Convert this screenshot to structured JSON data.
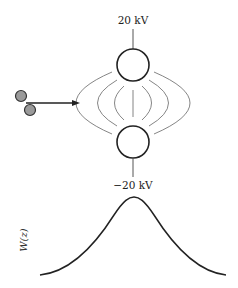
{
  "diagram": {
    "top_electrode": {
      "voltage_label": "20 kV"
    },
    "bottom_electrode": {
      "voltage_label": "−20 kV"
    },
    "plot": {
      "ylabel": "W(z)"
    },
    "icons": {
      "particles": "molecule-icon",
      "beam_arrow": "arrow-right-icon"
    },
    "colors": {
      "stroke": "#222222",
      "field_lines": "#666666",
      "particle_fill": "#9a9a9a"
    }
  }
}
